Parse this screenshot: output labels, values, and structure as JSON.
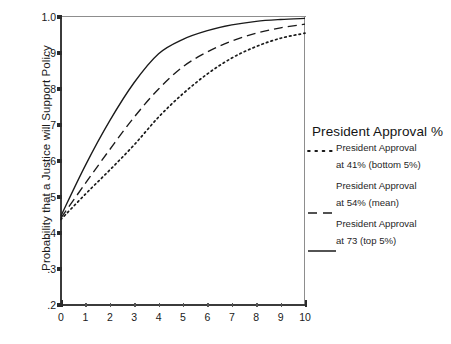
{
  "chart_data": {
    "type": "line",
    "title": "",
    "xlabel": "",
    "ylabel": "Probability that a Justice will Support Policy",
    "xlim": [
      0,
      10
    ],
    "ylim": [
      0.2,
      1.0
    ],
    "grid": false,
    "legend_position": "right",
    "legend_title": "President Approval %",
    "x": [
      0,
      1,
      2,
      3,
      4,
      5,
      6,
      7,
      8,
      9,
      10
    ],
    "xticklabels": [
      "0",
      "1",
      "2",
      "3",
      "4",
      "5",
      "6",
      "7",
      "8",
      "9",
      "10"
    ],
    "yticks": [
      0.2,
      0.3,
      0.4,
      0.5,
      0.6,
      0.7,
      0.8,
      0.9,
      1.0
    ],
    "yticklabels": [
      ".2",
      ".3",
      ".4",
      ".5",
      ".6",
      ".7",
      ".8",
      ".9",
      "1.0"
    ],
    "series": [
      {
        "name": "President Approval at 41% (bottom 5%)",
        "label_line1": "President Approval",
        "label_line2": "at 41% (bottom 5%)",
        "style": "dotted",
        "color": "#1a1a1a",
        "values": [
          0.438,
          0.508,
          0.575,
          0.645,
          0.722,
          0.787,
          0.842,
          0.886,
          0.918,
          0.941,
          0.955
        ]
      },
      {
        "name": "President Approval at 54% (mean)",
        "label_line1": "President Approval",
        "label_line2": "at 54% (mean)",
        "style": "dashed",
        "color": "#1a1a1a",
        "values": [
          0.442,
          0.538,
          0.632,
          0.722,
          0.8,
          0.862,
          0.903,
          0.933,
          0.955,
          0.97,
          0.98
        ]
      },
      {
        "name": "President Approval at 73 (top 5%)",
        "label_line1": "President Approval",
        "label_line2": "at 73 (top 5%)",
        "style": "solid",
        "color": "#1a1a1a",
        "values": [
          0.448,
          0.588,
          0.712,
          0.818,
          0.898,
          0.938,
          0.962,
          0.978,
          0.988,
          0.993,
          0.996
        ]
      }
    ]
  },
  "axes": {
    "y_axis_title": "Probability that a Justice will Support Policy"
  },
  "legend": {
    "title": "President Approval %",
    "items": [
      {
        "style": "dotted",
        "line1": "President Approval",
        "line2": "at 41% (bottom 5%)"
      },
      {
        "style": "dashed",
        "line1": "President Approval",
        "line2": "at 54% (mean)"
      },
      {
        "style": "solid",
        "line1": "President Approval",
        "line2": "at 73 (top 5%)"
      }
    ]
  }
}
